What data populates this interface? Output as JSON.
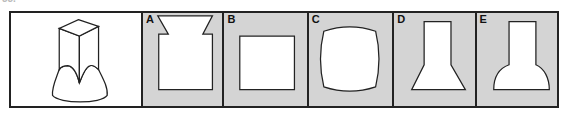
{
  "question": {
    "number_label": "33."
  },
  "reference_figure": {
    "description": "3D square prism standing on a flared base with a scalloped top edge"
  },
  "options": [
    {
      "label": "A",
      "shape": "square-with-funnel-top"
    },
    {
      "label": "B",
      "shape": "square"
    },
    {
      "label": "C",
      "shape": "square-with-convex-arced-sides"
    },
    {
      "label": "D",
      "shape": "rectangle-on-trapezoid"
    },
    {
      "label": "E",
      "shape": "rectangle-on-bell-curve"
    }
  ],
  "colors": {
    "option_background": "#d4d4d4",
    "reference_background": "#ffffff",
    "border": "#222222",
    "shape_fill": "#ffffff"
  }
}
